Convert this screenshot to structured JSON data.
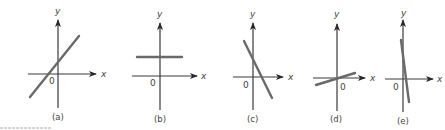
{
  "figure": {
    "panels": [
      {
        "id": "a",
        "caption": "(a)",
        "x_label": "x",
        "y_label": "y",
        "origin_label": "0",
        "line_description": "positive slope, positive intercept"
      },
      {
        "id": "b",
        "caption": "(b)",
        "x_label": "x",
        "y_label": "y",
        "origin_label": "0",
        "line_description": "zero slope (horizontal), positive intercept"
      },
      {
        "id": "c",
        "caption": "(c)",
        "x_label": "x",
        "y_label": "y",
        "origin_label": "0",
        "line_description": "negative slope, positive intercept"
      },
      {
        "id": "d",
        "caption": "(d)",
        "x_label": "x",
        "y_label": "y",
        "origin_label": "0",
        "line_description": "small positive slope through origin"
      },
      {
        "id": "e",
        "caption": "(e)",
        "x_label": "x",
        "y_label": "y",
        "origin_label": "0",
        "line_description": "steep negative slope, near vertical"
      }
    ]
  },
  "colors": {
    "axis": "#3a3a3a",
    "line": "#6a6a6a",
    "text": "#444444",
    "background": "#ffffff"
  }
}
